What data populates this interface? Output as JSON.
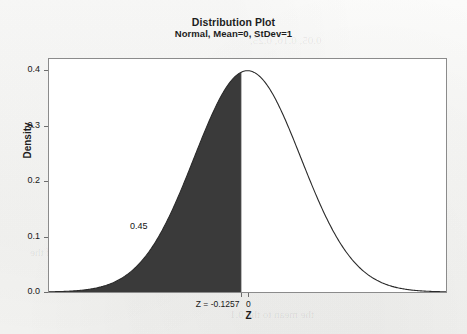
{
  "chart_data": {
    "type": "area",
    "title": "Distribution Plot",
    "subtitle": "Normal, Mean=0, StDev=1",
    "xlabel": "Z",
    "ylabel": "Density",
    "distribution": {
      "name": "Normal",
      "mean": 0,
      "stdev": 1
    },
    "xlim": [
      -3.72,
      3.72
    ],
    "ylim": [
      0.0,
      0.42
    ],
    "ytick_labels": [
      "0.0",
      "0.1",
      "0.2",
      "0.3",
      "0.4"
    ],
    "ytick_values": [
      0.0,
      0.1,
      0.2,
      0.3,
      0.4
    ],
    "xtick_labels": [
      "Z = -0.1257",
      "0"
    ],
    "xtick_values": [
      -0.1257,
      0
    ],
    "grid": false,
    "legend": false,
    "shaded_region": {
      "from": -3.72,
      "to": -0.1257,
      "probability_label": "0.45",
      "probability": 0.45,
      "color": "#3a3a3a",
      "tail": "left"
    },
    "curve_color": "#2a2a2a",
    "peak": {
      "x": 0,
      "y": 0.3989
    }
  },
  "plot": {
    "title": "Distribution Plot",
    "subtitle": "Normal, Mean=0, StDev=1",
    "ylabel": "Density",
    "xlabel": "Z",
    "area_label": "0.45",
    "ytick_labels": [
      "0.4",
      "0.3",
      "0.2",
      "0.1",
      "0.0"
    ],
    "xtick_z_label": "Z = -0.1257",
    "xtick_zero_label": "0"
  },
  "ghost_text": {
    "line1": "0.05, 0.16, 0.25,",
    "line2": "the mean to the 0.1",
    "line3": "is 0.45 of the"
  }
}
